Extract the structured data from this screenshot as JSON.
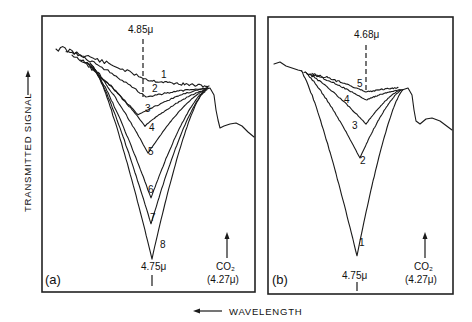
{
  "chart_data": {
    "type": "line",
    "title": "",
    "xlabel": "WAVELENGTH",
    "ylabel": "TRANSMITTED SIGNAL",
    "xlabel_arrow": "left",
    "ylabel_arrow": "up",
    "grid": false,
    "legend": "none",
    "note": "Schematic IR transmission traces; no numeric axes shown. Curve shapes approximated from the image; depth ordering only, no intensity values.",
    "panels": [
      {
        "tag": "(a)",
        "dashed_marker_label": "4.85μ",
        "bottom_marker_label": "4.75μ",
        "co2_label": "CO₂",
        "co2_wavelength_label": "(4.27μ)",
        "curve_labels": [
          "1",
          "2",
          "3",
          "4",
          "5",
          "6",
          "7",
          "8"
        ],
        "relative_depth_order": [
          1,
          2,
          3,
          4,
          5,
          6,
          7,
          8
        ]
      },
      {
        "tag": "(b)",
        "dashed_marker_label": "4.68μ",
        "bottom_marker_label": "4.75μ",
        "co2_label": "CO₂",
        "co2_wavelength_label": "(4.27μ)",
        "curve_labels": [
          "1",
          "2",
          "3",
          "4",
          "5"
        ],
        "relative_depth_order": [
          5,
          4,
          3,
          2,
          1
        ]
      }
    ]
  }
}
